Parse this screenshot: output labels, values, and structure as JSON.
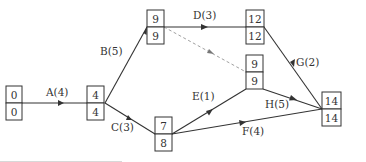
{
  "diagram": {
    "type": "activity-on-arrow network (critical path)",
    "nodes": [
      {
        "id": "n1",
        "top": "0",
        "bottom": "0"
      },
      {
        "id": "n2",
        "top": "4",
        "bottom": "4"
      },
      {
        "id": "n3",
        "top": "9",
        "bottom": "9"
      },
      {
        "id": "n4",
        "top": "12",
        "bottom": "12"
      },
      {
        "id": "n5",
        "top": "9",
        "bottom": "9"
      },
      {
        "id": "n6",
        "top": "7",
        "bottom": "8"
      },
      {
        "id": "n7",
        "top": "14",
        "bottom": "14"
      }
    ],
    "activities": [
      {
        "label": "A(4)",
        "from": "n1",
        "to": "n2"
      },
      {
        "label": "B(5)",
        "from": "n2",
        "to": "n3"
      },
      {
        "label": "C(3)",
        "from": "n2",
        "to": "n6"
      },
      {
        "label": "D(3)",
        "from": "n3",
        "to": "n4"
      },
      {
        "label": "E(1)",
        "from": "n6",
        "to": "n5"
      },
      {
        "label": "F(4)",
        "from": "n6",
        "to": "n7"
      },
      {
        "label": "G(2)",
        "from": "n4",
        "to": "n7"
      },
      {
        "label": "H(5)",
        "from": "n5",
        "to": "n7"
      },
      {
        "label": "",
        "from": "n3",
        "to": "n5",
        "dummy": true
      }
    ]
  }
}
